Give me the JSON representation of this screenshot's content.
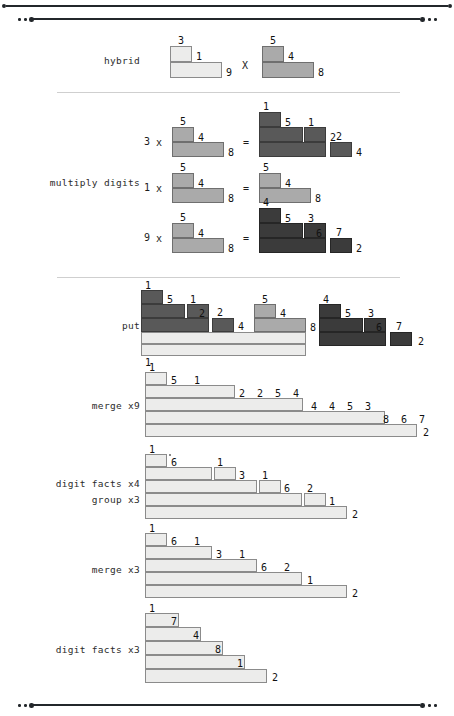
{
  "figure": {
    "kind": "strategy-trace-diagram",
    "colors": {
      "ink": "#23272b",
      "separator": "#cfcfcf",
      "bar_light": "#ececeb",
      "bar_medium": "#aaaaaa",
      "bar_dark": "#595959",
      "bar_darker": "#3b3b3b",
      "bar_stroke": "#6d6d6d"
    }
  },
  "rules": {
    "top_outer": {
      "dot_left": "•",
      "dot_right": "•"
    },
    "top_inner": {
      "dots_left": "• • •",
      "dots_right": "• • •"
    },
    "bottom": {
      "dots_left": "• • •",
      "dots_right": "• • •"
    }
  },
  "rows": [
    {
      "id": "hybrid",
      "labels": [
        "hybrid"
      ],
      "operator": "X",
      "operands": [
        {
          "name": "left-operand",
          "digits": [
            "3",
            "1",
            "9"
          ],
          "shade": "light"
        },
        {
          "name": "right-operand",
          "digits": [
            "5",
            "4",
            "8"
          ],
          "shade": "medium"
        }
      ]
    },
    {
      "id": "multiply-digits",
      "labels": [
        "multiply digits"
      ],
      "equations": [
        {
          "multiplier": "3",
          "times": "x",
          "equals": "=",
          "operand_digits": [
            "5",
            "4",
            "8"
          ],
          "operand_shade": "medium",
          "result_digits": [
            "1",
            "5",
            "1",
            "2",
            "2",
            "4"
          ],
          "result_shade": "dark"
        },
        {
          "multiplier": "1",
          "times": "x",
          "equals": "=",
          "operand_digits": [
            "5",
            "4",
            "8"
          ],
          "operand_shade": "medium",
          "result_digits": [
            "5",
            "4",
            "8"
          ],
          "result_shade": "medium"
        },
        {
          "multiplier": "9",
          "times": "x",
          "equals": "=",
          "operand_digits": [
            "5",
            "4",
            "8"
          ],
          "operand_shade": "medium",
          "result_digits": [
            "4",
            "5",
            "3",
            "6",
            "7",
            "2"
          ],
          "result_shade": "darker"
        }
      ]
    },
    {
      "id": "put",
      "labels": [
        "put"
      ],
      "digits_left_group": [
        "1",
        "5",
        "1",
        "2",
        "2",
        "4"
      ],
      "digits_middle_group": [
        "5",
        "4",
        "8"
      ],
      "digits_right_group": [
        "4",
        "5",
        "3",
        "6",
        "7",
        "2"
      ],
      "digit_bottom": "1"
    },
    {
      "id": "merge-x9",
      "labels": [
        "merge x9"
      ],
      "digits": [
        "1",
        "5",
        "1",
        "2",
        "2",
        "5",
        "4",
        "4",
        "4",
        "5",
        "3",
        "8",
        "6",
        "7",
        "2"
      ]
    },
    {
      "id": "digit-facts-x4-group-x3",
      "labels": [
        "digit facts x4",
        "group x3"
      ],
      "digits": [
        "1",
        "6",
        "1",
        "3",
        "1",
        "6",
        "2",
        "1",
        "2"
      ]
    },
    {
      "id": "merge-x3",
      "labels": [
        "merge x3"
      ],
      "digits": [
        "1",
        "6",
        "1",
        "3",
        "1",
        "6",
        "2",
        "1",
        "2"
      ]
    },
    {
      "id": "digit-facts-x3",
      "labels": [
        "digit facts x3"
      ],
      "digits": [
        "1",
        "7",
        "4",
        "8",
        "1",
        "2"
      ]
    }
  ]
}
